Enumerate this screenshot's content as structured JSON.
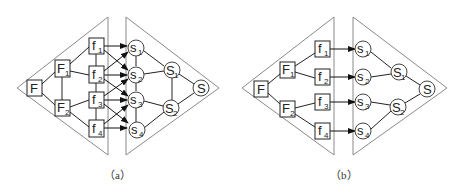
{
  "figure": {
    "panels": [
      {
        "id": "a",
        "caption": "（a）",
        "function_nodes": [
          {
            "id": "F",
            "label": "F",
            "sub": ""
          },
          {
            "id": "F1",
            "label": "F",
            "sub": "1"
          },
          {
            "id": "F2",
            "label": "F",
            "sub": "2"
          },
          {
            "id": "f1",
            "label": "f",
            "sub": "1"
          },
          {
            "id": "f2",
            "label": "f",
            "sub": "2"
          },
          {
            "id": "f3",
            "label": "f",
            "sub": "3"
          },
          {
            "id": "f4",
            "label": "f",
            "sub": "4"
          }
        ],
        "structure_nodes": [
          {
            "id": "s1",
            "label": "s",
            "sub": "1"
          },
          {
            "id": "s2",
            "label": "s",
            "sub": "2"
          },
          {
            "id": "s3",
            "label": "s",
            "sub": "3"
          },
          {
            "id": "s4",
            "label": "s",
            "sub": "4"
          },
          {
            "id": "S1",
            "label": "S",
            "sub": "1"
          },
          {
            "id": "S2",
            "label": "S",
            "sub": "2"
          },
          {
            "id": "S",
            "label": "S",
            "sub": ""
          }
        ],
        "mappings": [
          "f1→s1",
          "f1→s2",
          "f2→s1",
          "f2→s2",
          "f2→s3",
          "f3→s2",
          "f3→s3",
          "f3→s4",
          "f4→s3",
          "f4→s4"
        ]
      },
      {
        "id": "b",
        "caption": "（b）",
        "function_nodes": [
          {
            "id": "F",
            "label": "F",
            "sub": ""
          },
          {
            "id": "F1",
            "label": "F",
            "sub": "1"
          },
          {
            "id": "F2",
            "label": "F",
            "sub": "2"
          },
          {
            "id": "f1",
            "label": "f",
            "sub": "1"
          },
          {
            "id": "f2",
            "label": "f",
            "sub": "2"
          },
          {
            "id": "f3",
            "label": "f",
            "sub": "3"
          },
          {
            "id": "f4",
            "label": "f",
            "sub": "4"
          }
        ],
        "structure_nodes": [
          {
            "id": "s1",
            "label": "s",
            "sub": "1"
          },
          {
            "id": "s2",
            "label": "s",
            "sub": "2"
          },
          {
            "id": "s3",
            "label": "s",
            "sub": "3"
          },
          {
            "id": "s4",
            "label": "s",
            "sub": "4"
          },
          {
            "id": "S1",
            "label": "S",
            "sub": "1"
          },
          {
            "id": "S2",
            "label": "S",
            "sub": "2"
          },
          {
            "id": "S",
            "label": "S",
            "sub": ""
          }
        ],
        "mappings": [
          "f1→s1",
          "f2→s2",
          "f3→s3",
          "f4→s4"
        ]
      }
    ]
  }
}
